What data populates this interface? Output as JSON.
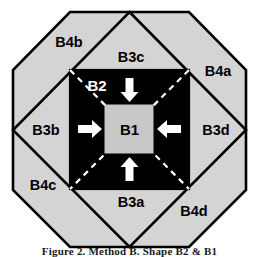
{
  "figure": {
    "caption": "Figure 2. Method B. Shape B2 & B1",
    "colors": {
      "outer_fill": "#d4d4d4",
      "inner_fill": "#000000",
      "center_fill": "#c8c8c8",
      "stroke": "#000000",
      "dash": "#ffffff",
      "arrow": "#ffffff"
    },
    "regions": {
      "center": {
        "label": "B1",
        "name": "center-square"
      },
      "inner_square": {
        "label": "B2",
        "name": "inner-black-square"
      },
      "triangles": [
        {
          "label": "B3a",
          "name": "triangle-bottom"
        },
        {
          "label": "B3b",
          "name": "triangle-left"
        },
        {
          "label": "B3c",
          "name": "triangle-top"
        },
        {
          "label": "B3d",
          "name": "triangle-right"
        }
      ],
      "corners": [
        {
          "label": "B4a",
          "name": "corner-top-right"
        },
        {
          "label": "B4b",
          "name": "corner-top-left"
        },
        {
          "label": "B4c",
          "name": "corner-bottom-left"
        },
        {
          "label": "B4d",
          "name": "corner-bottom-right"
        }
      ]
    },
    "arrows": [
      {
        "name": "arrow-down",
        "direction": "down"
      },
      {
        "name": "arrow-up",
        "direction": "up"
      },
      {
        "name": "arrow-right",
        "direction": "right"
      },
      {
        "name": "arrow-left",
        "direction": "left"
      }
    ]
  }
}
